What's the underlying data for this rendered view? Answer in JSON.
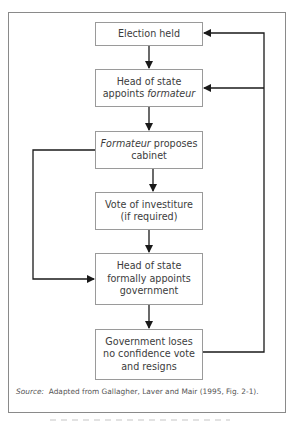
{
  "diagram": {
    "type": "flowchart",
    "boxes": [
      {
        "id": "election",
        "lines": [
          {
            "text": "Election held"
          }
        ]
      },
      {
        "id": "appoint-formateur",
        "lines": [
          {
            "text": "Head of state"
          },
          {
            "prefix": "appoints ",
            "italic": "formateur"
          }
        ]
      },
      {
        "id": "propose-cabinet",
        "lines": [
          {
            "italic": "Formateur",
            "suffix": " proposes"
          },
          {
            "text": "cabinet"
          }
        ]
      },
      {
        "id": "investiture",
        "lines": [
          {
            "text": "Vote of investiture"
          },
          {
            "text": "(if required)"
          }
        ]
      },
      {
        "id": "formal-appoint",
        "lines": [
          {
            "text": "Head of state"
          },
          {
            "text": "formally appoints"
          },
          {
            "text": "government"
          }
        ]
      },
      {
        "id": "loses-vote",
        "lines": [
          {
            "text": "Government loses"
          },
          {
            "text": "no confidence vote"
          },
          {
            "text": "and resigns"
          }
        ]
      }
    ],
    "edges": [
      {
        "from": "election",
        "to": "appoint-formateur"
      },
      {
        "from": "appoint-formateur",
        "to": "propose-cabinet"
      },
      {
        "from": "propose-cabinet",
        "to": "investiture"
      },
      {
        "from": "investiture",
        "to": "formal-appoint"
      },
      {
        "from": "propose-cabinet",
        "to": "formal-appoint",
        "route": "left bypass"
      },
      {
        "from": "formal-appoint",
        "to": "loses-vote"
      },
      {
        "from": "loses-vote",
        "to": "election",
        "route": "right feedback"
      },
      {
        "from": "loses-vote",
        "to": "appoint-formateur",
        "route": "right feedback"
      }
    ],
    "source": {
      "label": "Source:",
      "text": "  Adapted from Gallagher, Laver and Mair (1995, Fig. 2-1)."
    },
    "colors": {
      "line": "#1a1a1a",
      "box_border": "#9a9a9a",
      "frame_border": "#8a8a8a",
      "text": "#3c3c3c"
    }
  }
}
